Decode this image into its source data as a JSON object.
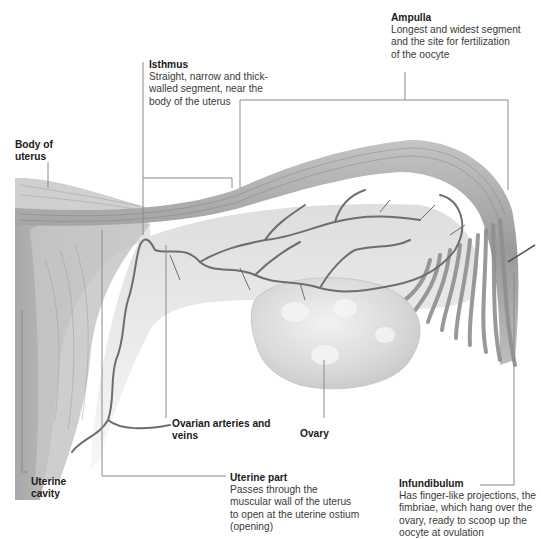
{
  "diagram": {
    "labels": [
      {
        "id": "ampulla",
        "title": "Ampulla",
        "desc": "Longest and widest segment and the site for fertilization of the oocyte"
      },
      {
        "id": "isthmus",
        "title": "Isthmus",
        "desc": "Straight, narrow and thick-walled segment, near the body of the uterus"
      },
      {
        "id": "body",
        "title": "Body of uterus",
        "desc": ""
      },
      {
        "id": "ovarian",
        "title": "Ovarian arteries and veins",
        "desc": ""
      },
      {
        "id": "ovary",
        "title": "Ovary",
        "desc": ""
      },
      {
        "id": "cavity",
        "title": "Uterine cavity",
        "desc": ""
      },
      {
        "id": "uterine_part",
        "title": "Uterine part",
        "desc": "Passes through the muscular wall of the uterus to open at the uterine ostium (opening)"
      },
      {
        "id": "infundibulum",
        "title": "Infundibulum",
        "desc": "Has finger-like projections, the fimbriae, which hang over the ovary, ready to scoop up the oocyte at ovulation"
      }
    ],
    "colors": {
      "tissue_dark": "#8c8c8c",
      "tissue_mid": "#b5b5b5",
      "tissue_light": "#dcdcdc",
      "vessel": "#6a6a6a",
      "ovary": "#d6d6d6",
      "leader": "#8a8a8a",
      "text": "#222222"
    }
  }
}
